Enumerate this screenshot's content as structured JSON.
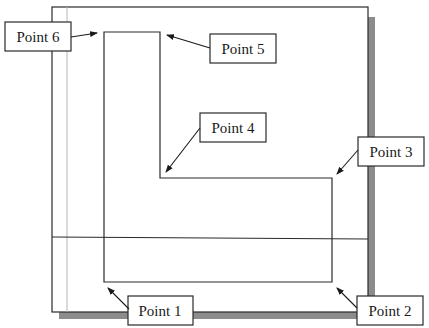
{
  "diagram": {
    "points": [
      {
        "id": "point-1",
        "label": "Point 1"
      },
      {
        "id": "point-2",
        "label": "Point 2"
      },
      {
        "id": "point-3",
        "label": "Point 3"
      },
      {
        "id": "point-4",
        "label": "Point 4"
      },
      {
        "id": "point-5",
        "label": "Point 5"
      },
      {
        "id": "point-6",
        "label": "Point 6"
      }
    ],
    "colors": {
      "line": "#2a2a2a",
      "frame": "#2a2a2a",
      "shadow": "#8c8c8c",
      "guide": "#b5b5b5",
      "label_border": "#2a2a2a",
      "label_fill": "#ffffff"
    }
  }
}
